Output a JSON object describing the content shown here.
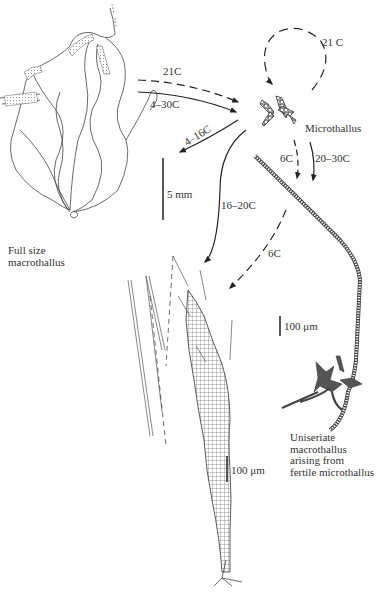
{
  "figure": {
    "type": "life-cycle diagram"
  },
  "labels": {
    "full_size_line1": "Full size",
    "full_size_line2": "macrothallus",
    "microthallus": "Microthallus",
    "uniseriate_line1": "Uniseriate",
    "uniseriate_line2": "macrothallus",
    "uniseriate_line3": "arising from",
    "uniseriate_line4": "fertile microthallus"
  },
  "arrows": [
    {
      "id": "loop",
      "label": "21 C",
      "style": "dashed",
      "from": "microthallus",
      "to": "microthallus"
    },
    {
      "id": "to-micro-dashed",
      "label": "21C",
      "style": "dashed",
      "from": "full-size-macrothallus",
      "to": "microthallus"
    },
    {
      "id": "to-micro-solid",
      "label": "4–30C",
      "style": "solid",
      "from": "full-size-macrothallus",
      "to": "microthallus"
    },
    {
      "id": "to-macro",
      "label": "4–16C",
      "style": "solid",
      "from": "microthallus",
      "to": "full-size-macrothallus"
    },
    {
      "id": "down-6c",
      "label": "6C",
      "style": "dashed",
      "from": "microthallus",
      "to": "uniseriate-macrothallus"
    },
    {
      "id": "down-20-30",
      "label": "20–30C",
      "style": "solid",
      "from": "microthallus",
      "to": "uniseriate-macrothallus"
    },
    {
      "id": "to-young",
      "label": "16–20C",
      "style": "solid",
      "from": "microthallus",
      "to": "young-macrothallus"
    },
    {
      "id": "to-young-6c",
      "label": "6C",
      "style": "dashed",
      "from": "microthallus",
      "to": "young-macrothallus"
    }
  ],
  "scale_bars": {
    "mm": "5 mm",
    "um_upper": "100 μm",
    "um_lower": "100 μm"
  }
}
